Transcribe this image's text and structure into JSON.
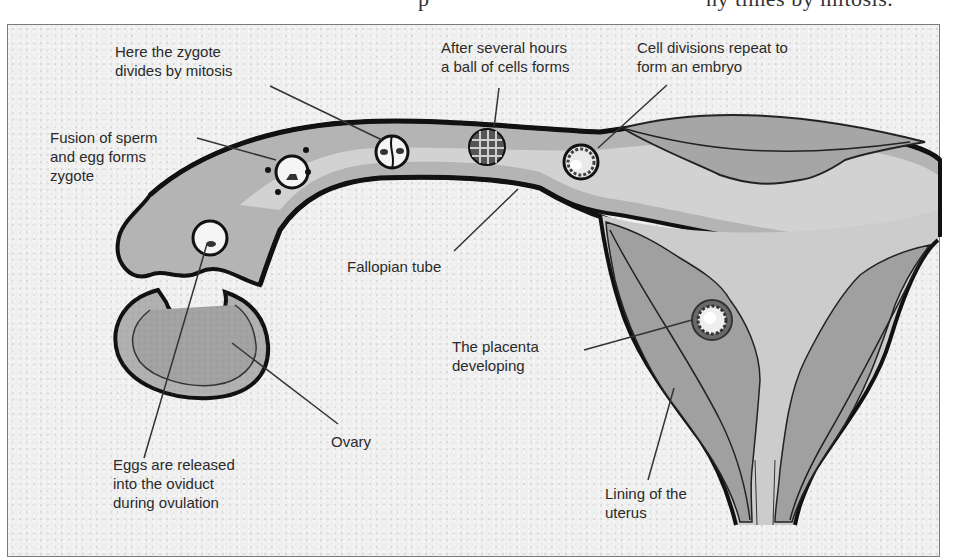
{
  "page": {
    "top_caption_fragment_left": "p",
    "top_caption_fragment_right": "ny times by mitosis."
  },
  "diagram": {
    "title": "",
    "colors": {
      "background": "#efefef",
      "tube_light": "#cfcfcf",
      "tissue_mid": "#a8a8a8",
      "tissue_dark": "#8c8c8c",
      "outline": "#111111",
      "text": "#2a2a2a",
      "frame": "#7a7a7a"
    },
    "labels": {
      "zygote_mitosis": "Here the zygote\ndivides by mitosis",
      "ball_of_cells": "After several hours\na ball of cells forms",
      "embryo": "Cell divisions repeat to\nform an embryo",
      "fusion": "Fusion of sperm\nand egg forms\nzygote",
      "fallopian_tube": "Fallopian tube",
      "placenta": "The placenta\ndeveloping",
      "ovary": "Ovary",
      "eggs_released": "Eggs are released\ninto the oviduct\nduring ovulation",
      "uterus_lining": "Lining of the\nuterus"
    },
    "structures": [
      "ovary",
      "oviduct / fallopian tube",
      "egg",
      "zygote",
      "two-cell stage",
      "ball of cells",
      "embryo",
      "uterus",
      "uterus lining",
      "placenta"
    ]
  }
}
